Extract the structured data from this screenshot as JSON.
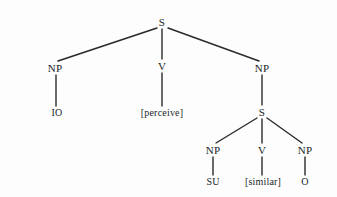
{
  "figure": {
    "type": "syntax-tree",
    "background_color": "#fdfdfd",
    "stroke_color": "#2a2a2a",
    "text_color": "#201f1f"
  },
  "nodes": {
    "root_s": {
      "label": "S",
      "x": 162,
      "y": 22
    },
    "np_io": {
      "label": "NP",
      "x": 55,
      "y": 68
    },
    "v_matrix": {
      "label": "V",
      "x": 162,
      "y": 66
    },
    "np_object": {
      "label": "NP",
      "x": 262,
      "y": 68
    },
    "term_io": {
      "label": "IO",
      "x": 57,
      "y": 113
    },
    "term_perceive": {
      "label": "[perceive]",
      "x": 162,
      "y": 113
    },
    "embedded_s": {
      "label": "S",
      "x": 262,
      "y": 112
    },
    "np_su": {
      "label": "NP",
      "x": 213,
      "y": 150
    },
    "v_embedded": {
      "label": "V",
      "x": 262,
      "y": 150
    },
    "np_o": {
      "label": "NP",
      "x": 305,
      "y": 150
    },
    "term_su": {
      "label": "SU",
      "x": 213,
      "y": 182
    },
    "term_similar": {
      "label": "[similar]",
      "x": 263,
      "y": 182
    },
    "term_o": {
      "label": "O",
      "x": 305,
      "y": 182
    }
  },
  "edges": [
    {
      "from": "root_s",
      "to": "np_io",
      "x1": 157,
      "y1": 28,
      "x2": 58,
      "y2": 61
    },
    {
      "from": "root_s",
      "to": "v_matrix",
      "x1": 162,
      "y1": 29,
      "x2": 162,
      "y2": 59
    },
    {
      "from": "root_s",
      "to": "np_object",
      "x1": 168,
      "y1": 28,
      "x2": 259,
      "y2": 61
    },
    {
      "from": "np_io",
      "to": "term_io",
      "x1": 56,
      "y1": 75,
      "x2": 56,
      "y2": 106
    },
    {
      "from": "v_matrix",
      "to": "term_perceive",
      "x1": 162,
      "y1": 73,
      "x2": 162,
      "y2": 106
    },
    {
      "from": "np_object",
      "to": "embedded_s",
      "x1": 262,
      "y1": 75,
      "x2": 262,
      "y2": 105
    },
    {
      "from": "embedded_s",
      "to": "np_su",
      "x1": 257,
      "y1": 118,
      "x2": 216,
      "y2": 143
    },
    {
      "from": "embedded_s",
      "to": "v_embedded",
      "x1": 262,
      "y1": 119,
      "x2": 262,
      "y2": 143
    },
    {
      "from": "embedded_s",
      "to": "np_o",
      "x1": 267,
      "y1": 118,
      "x2": 302,
      "y2": 143
    },
    {
      "from": "np_su",
      "to": "term_su",
      "x1": 213,
      "y1": 157,
      "x2": 213,
      "y2": 175
    },
    {
      "from": "v_embedded",
      "to": "term_similar",
      "x1": 262,
      "y1": 157,
      "x2": 262,
      "y2": 175
    },
    {
      "from": "np_o",
      "to": "term_o",
      "x1": 305,
      "y1": 157,
      "x2": 305,
      "y2": 175
    }
  ]
}
